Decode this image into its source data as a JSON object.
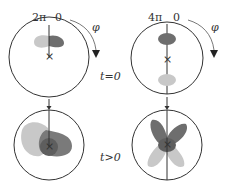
{
  "panels": [
    {
      "top_left_label": "2π",
      "top_right_label": "0",
      "phi_label": "φ"
    },
    {
      "top_left_label": "4π",
      "top_right_label": "0",
      "phi_label": "φ"
    }
  ],
  "row_labels": {
    "t0": "t=0",
    "tpos": "t>0"
  },
  "colors": {
    "dark": "#6e6e6e",
    "light": "#c8c8c8",
    "stroke": "#333333"
  }
}
